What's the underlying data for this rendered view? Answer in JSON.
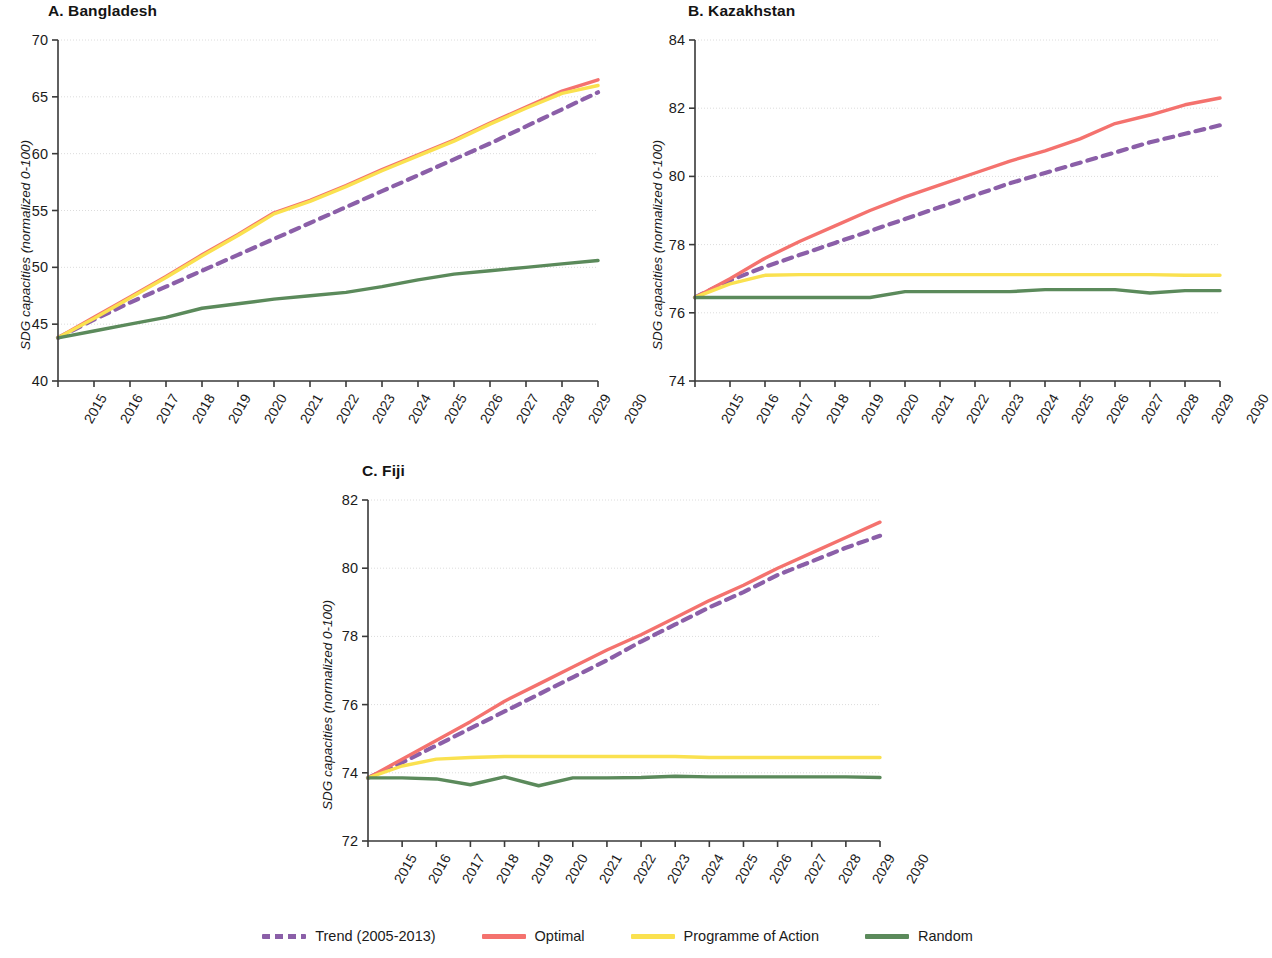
{
  "figure": {
    "ylabel": "SDG capacities (normalized 0-100)",
    "colors": {
      "trend": "#8B5FA8",
      "optimal": "#F4726E",
      "programme": "#FAE14F",
      "random": "#5B8A5B",
      "axis": "#3a3a3a",
      "grid": "#dcdcdc"
    }
  },
  "legend": {
    "items": [
      {
        "label": "Trend (2005-2013)",
        "color": "#8B5FA8",
        "style": "dashed",
        "name": "trend"
      },
      {
        "label": "Optimal",
        "color": "#F4726E",
        "style": "solid",
        "name": "optimal"
      },
      {
        "label": "Programme of Action",
        "color": "#FAE14F",
        "style": "solid",
        "name": "programme-of-action"
      },
      {
        "label": "Random",
        "color": "#5B8A5B",
        "style": "solid",
        "name": "random"
      }
    ]
  },
  "chart_data": [
    {
      "type": "line",
      "panel": "A",
      "title": "A. Bangladesh",
      "xlabel": "",
      "ylabel": "SDG capacities (normalized 0-100)",
      "x": [
        2015,
        2016,
        2017,
        2018,
        2019,
        2020,
        2021,
        2022,
        2023,
        2024,
        2025,
        2026,
        2027,
        2028,
        2029,
        2030
      ],
      "xlim": [
        2015,
        2030
      ],
      "ylim": [
        40,
        70
      ],
      "yticks": [
        40,
        45,
        50,
        55,
        60,
        65,
        70
      ],
      "xticks": [
        "2015",
        "2016",
        "2017",
        "2018",
        "2019",
        "2020",
        "2021",
        "2022",
        "2023",
        "2024",
        "2025",
        "2026",
        "2027",
        "2028",
        "2029",
        "2030"
      ],
      "grid": true,
      "legend_position": "bottom",
      "series": [
        {
          "name": "Trend (2005-2013)",
          "color": "#8B5FA8",
          "style": "dashed",
          "values": [
            43.8,
            45.4,
            46.9,
            48.3,
            49.7,
            51.1,
            52.5,
            53.9,
            55.3,
            56.7,
            58.1,
            59.5,
            60.9,
            62.4,
            63.9,
            65.4
          ]
        },
        {
          "name": "Optimal",
          "color": "#F4726E",
          "style": "solid",
          "values": [
            43.8,
            45.6,
            47.4,
            49.2,
            51.1,
            52.9,
            54.8,
            55.9,
            57.2,
            58.6,
            59.9,
            61.2,
            62.7,
            64.1,
            65.5,
            66.5
          ]
        },
        {
          "name": "Programme of Action",
          "color": "#FAE14F",
          "style": "solid",
          "values": [
            43.8,
            45.5,
            47.3,
            49.1,
            51.0,
            52.8,
            54.7,
            55.8,
            57.1,
            58.5,
            59.8,
            61.1,
            62.6,
            64.0,
            65.3,
            66.0
          ]
        },
        {
          "name": "Random",
          "color": "#5B8A5B",
          "style": "solid",
          "values": [
            43.8,
            44.4,
            45.0,
            45.6,
            46.4,
            46.8,
            47.2,
            47.5,
            47.8,
            48.3,
            48.9,
            49.4,
            49.7,
            50.0,
            50.3,
            50.6
          ]
        }
      ]
    },
    {
      "type": "line",
      "panel": "B",
      "title": "B. Kazakhstan",
      "xlabel": "",
      "ylabel": "SDG capacities (normalized 0-100)",
      "x": [
        2015,
        2016,
        2017,
        2018,
        2019,
        2020,
        2021,
        2022,
        2023,
        2024,
        2025,
        2026,
        2027,
        2028,
        2029,
        2030
      ],
      "xlim": [
        2015,
        2030
      ],
      "ylim": [
        74,
        84
      ],
      "yticks": [
        74,
        76,
        78,
        80,
        82,
        84
      ],
      "xticks": [
        "2015",
        "2016",
        "2017",
        "2018",
        "2019",
        "2020",
        "2021",
        "2022",
        "2023",
        "2024",
        "2025",
        "2026",
        "2027",
        "2028",
        "2029",
        "2030"
      ],
      "grid": true,
      "legend_position": "bottom",
      "series": [
        {
          "name": "Trend (2005-2013)",
          "color": "#8B5FA8",
          "style": "dashed",
          "values": [
            76.45,
            76.95,
            77.35,
            77.7,
            78.05,
            78.4,
            78.75,
            79.1,
            79.45,
            79.8,
            80.1,
            80.4,
            80.7,
            81.0,
            81.25,
            81.5
          ]
        },
        {
          "name": "Optimal",
          "color": "#F4726E",
          "style": "solid",
          "values": [
            76.45,
            77.0,
            77.6,
            78.1,
            78.55,
            79.0,
            79.4,
            79.75,
            80.1,
            80.45,
            80.75,
            81.1,
            81.55,
            81.8,
            82.1,
            82.3
          ]
        },
        {
          "name": "Programme of Action",
          "color": "#FAE14F",
          "style": "solid",
          "values": [
            76.45,
            76.85,
            77.1,
            77.12,
            77.12,
            77.12,
            77.12,
            77.12,
            77.12,
            77.12,
            77.12,
            77.12,
            77.12,
            77.12,
            77.1,
            77.1
          ]
        },
        {
          "name": "Random",
          "color": "#5B8A5B",
          "style": "solid",
          "values": [
            76.45,
            76.45,
            76.45,
            76.45,
            76.45,
            76.45,
            76.62,
            76.62,
            76.62,
            76.62,
            76.68,
            76.68,
            76.68,
            76.58,
            76.65,
            76.65
          ]
        }
      ]
    },
    {
      "type": "line",
      "panel": "C",
      "title": "C. Fiji",
      "xlabel": "",
      "ylabel": "SDG capacities (normalized 0-100)",
      "x": [
        2015,
        2016,
        2017,
        2018,
        2019,
        2020,
        2021,
        2022,
        2023,
        2024,
        2025,
        2026,
        2027,
        2028,
        2029,
        2030
      ],
      "xlim": [
        2015,
        2030
      ],
      "ylim": [
        72,
        82
      ],
      "yticks": [
        72,
        74,
        76,
        78,
        80,
        82
      ],
      "xticks": [
        "2015",
        "2016",
        "2017",
        "2018",
        "2019",
        "2020",
        "2021",
        "2022",
        "2023",
        "2024",
        "2025",
        "2026",
        "2027",
        "2028",
        "2029",
        "2030"
      ],
      "grid": true,
      "legend_position": "bottom",
      "series": [
        {
          "name": "Trend (2005-2013)",
          "color": "#8B5FA8",
          "style": "dashed",
          "values": [
            73.85,
            74.3,
            74.8,
            75.3,
            75.8,
            76.3,
            76.8,
            77.3,
            77.85,
            78.35,
            78.85,
            79.3,
            79.8,
            80.2,
            80.6,
            80.95
          ]
        },
        {
          "name": "Optimal",
          "color": "#F4726E",
          "style": "solid",
          "values": [
            73.85,
            74.4,
            74.95,
            75.5,
            76.1,
            76.6,
            77.1,
            77.6,
            78.05,
            78.55,
            79.05,
            79.5,
            80.0,
            80.45,
            80.9,
            81.35
          ]
        },
        {
          "name": "Programme of Action",
          "color": "#FAE14F",
          "style": "solid",
          "values": [
            73.85,
            74.2,
            74.4,
            74.45,
            74.48,
            74.48,
            74.48,
            74.48,
            74.48,
            74.48,
            74.45,
            74.45,
            74.45,
            74.45,
            74.45,
            74.45
          ]
        },
        {
          "name": "Random",
          "color": "#5B8A5B",
          "style": "solid",
          "values": [
            73.85,
            73.85,
            73.82,
            73.65,
            73.88,
            73.62,
            73.85,
            73.85,
            73.86,
            73.9,
            73.88,
            73.88,
            73.88,
            73.88,
            73.88,
            73.86
          ]
        }
      ]
    }
  ]
}
